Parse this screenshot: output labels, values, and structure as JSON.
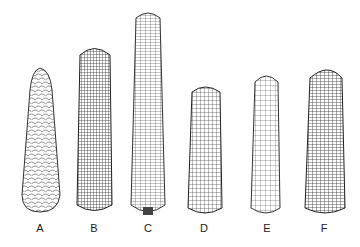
{
  "figure": {
    "ears": [
      {
        "label": "A",
        "type": "tapered-large-kernels"
      },
      {
        "label": "B",
        "type": "fine-dense-kernels"
      },
      {
        "label": "C",
        "type": "long-slender-rows"
      },
      {
        "label": "D",
        "type": "short-dense"
      },
      {
        "label": "E",
        "type": "medium-large-kernels"
      },
      {
        "label": "F",
        "type": "wide-irregular-rows"
      }
    ]
  }
}
